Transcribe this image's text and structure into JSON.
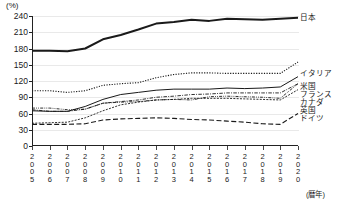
{
  "chart_data": {
    "type": "line",
    "title": "",
    "xlabel": "(暦年)",
    "ylabel": "(%)",
    "ylim": [
      0,
      240
    ],
    "yticks": [
      0,
      30,
      60,
      90,
      120,
      150,
      180,
      210,
      240
    ],
    "grid": true,
    "legend_position": "right",
    "x": [
      "2005",
      "2006",
      "2007",
      "2008",
      "2009",
      "2010",
      "2011",
      "2012",
      "2013",
      "2014",
      "2015",
      "2016",
      "2017",
      "2018",
      "2019",
      "2020"
    ],
    "series": [
      {
        "name": "日本",
        "style": "solid-thick",
        "values": [
          176,
          176,
          175,
          180,
          197,
          205,
          215,
          226,
          229,
          233,
          231,
          235,
          234,
          233,
          235,
          237
        ]
      },
      {
        "name": "イタリア",
        "style": "dotted",
        "values": [
          102,
          102,
          99,
          102,
          112,
          115,
          117,
          126,
          132,
          135,
          135,
          134,
          134,
          134,
          134,
          155
        ]
      },
      {
        "name": "米国",
        "style": "solid-thin",
        "values": [
          65,
          64,
          64,
          73,
          86,
          95,
          99,
          103,
          105,
          105,
          105,
          107,
          106,
          107,
          109,
          128
        ]
      },
      {
        "name": "フランス",
        "style": "dash-dot",
        "values": [
          67,
          64,
          64,
          68,
          79,
          82,
          85,
          90,
          92,
          95,
          96,
          98,
          98,
          98,
          98,
          115
        ]
      },
      {
        "name": "カナダ",
        "style": "dash-dot-dot",
        "values": [
          70,
          70,
          67,
          68,
          79,
          81,
          82,
          85,
          86,
          85,
          91,
          92,
          91,
          90,
          88,
          115
        ]
      },
      {
        "name": "英国",
        "style": "dashed-fine",
        "values": [
          42,
          43,
          44,
          52,
          65,
          76,
          81,
          85,
          86,
          88,
          88,
          88,
          87,
          86,
          85,
          104
        ]
      },
      {
        "name": "ドイツ",
        "style": "dashed-long",
        "values": [
          40,
          40,
          40,
          41,
          48,
          50,
          51,
          52,
          51,
          49,
          48,
          46,
          44,
          41,
          40,
          60
        ]
      }
    ]
  },
  "legend": {
    "items": [
      {
        "label": "日本"
      },
      {
        "label": "イタリア"
      },
      {
        "label": "米国"
      },
      {
        "label": "フランス"
      },
      {
        "label": "カナダ"
      },
      {
        "label": "英国"
      },
      {
        "label": "ドイツ"
      }
    ]
  },
  "colors": {
    "line": "#1a1a1a",
    "grid": "#e9e9e9",
    "axis": "#222222"
  }
}
